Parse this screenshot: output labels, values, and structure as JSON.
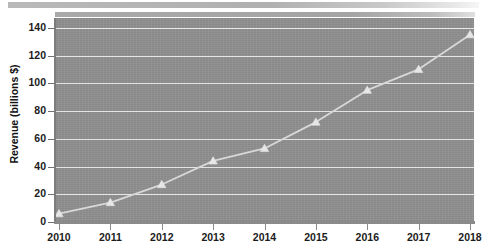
{
  "chart_data": {
    "type": "line",
    "title": "",
    "xlabel": "",
    "ylabel": "Revenue (billions $)",
    "x": [
      2010,
      2011,
      2012,
      2013,
      2014,
      2015,
      2016,
      2017,
      2018
    ],
    "categories": [
      "2010",
      "2011",
      "2012",
      "2013",
      "2014",
      "2015",
      "2016",
      "2017",
      "2018"
    ],
    "values": [
      6,
      14,
      27,
      44,
      53,
      72,
      95,
      110,
      135
    ],
    "series": [
      {
        "name": "Revenue",
        "values": [
          6,
          14,
          27,
          44,
          53,
          72,
          95,
          110,
          135
        ]
      }
    ],
    "ylim": [
      0,
      147
    ],
    "xlim": [
      2010,
      2018
    ],
    "y_ticks": [
      0,
      20,
      40,
      60,
      80,
      100,
      120,
      140
    ],
    "y_tick_labels": [
      "0",
      "20",
      "40",
      "60",
      "80",
      "100",
      "120",
      "140"
    ],
    "x_ticks": [
      2010,
      2011,
      2012,
      2013,
      2014,
      2015,
      2016,
      2017,
      2018
    ],
    "x_tick_labels": [
      "2010",
      "2011",
      "2012",
      "2013",
      "2014",
      "2015",
      "2016",
      "2017",
      "2018"
    ],
    "grid": true,
    "grid_axis": "y",
    "legend": false,
    "legend_position": "none",
    "marker": "triangle",
    "colors": {
      "plot_background": "#8e8e8e",
      "gridline": "#e4e4e4",
      "series_line": "#d8d8d8",
      "marker_fill": "#e6e6e6",
      "axis": "#8a8a8a",
      "tick_label": "#1b1b1b",
      "axis_title": "#111111",
      "page_background": "#ffffff",
      "header_bar": "#b0b0b0"
    }
  },
  "header": {
    "top_bar_label": "",
    "second_bar_label": ""
  }
}
